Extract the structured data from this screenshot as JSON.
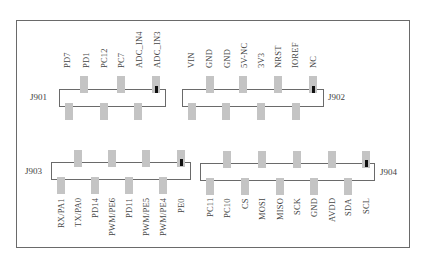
{
  "diagram": {
    "type": "pin-header-layout",
    "frame": {
      "stroke": "#6a6a6a"
    },
    "pin_fill": "#c4c4c4",
    "pin1_marker": "#111111",
    "connectors": [
      {
        "id": "J901",
        "label": "J901",
        "box": {
          "x": 59,
          "y": 89,
          "w": 107,
          "h": 18
        },
        "label_pos": {
          "x": 30,
          "y": 94
        },
        "labels_side": "top",
        "pins_top_x": [
          84,
          121,
          156
        ],
        "pins_bottom_x": [
          69,
          104,
          138
        ],
        "pin1_x": 156,
        "pin_labels": [
          {
            "text": "PD7",
            "x": 67
          },
          {
            "text": "PD1",
            "x": 86
          },
          {
            "text": "PC12",
            "x": 104
          },
          {
            "text": "PC7",
            "x": 121
          },
          {
            "text": "ADC_IN4",
            "x": 139
          },
          {
            "text": "ADC_IN3",
            "x": 157
          }
        ]
      },
      {
        "id": "J902",
        "label": "J902",
        "box": {
          "x": 182,
          "y": 89,
          "w": 142,
          "h": 18
        },
        "label_pos": {
          "x": 328,
          "y": 94
        },
        "labels_side": "top",
        "pins_top_x": [
          210,
          243,
          278,
          313
        ],
        "pins_bottom_x": [
          192,
          226,
          261,
          296
        ],
        "pin1_x": 313,
        "pin_labels": [
          {
            "text": "VIN",
            "x": 191
          },
          {
            "text": "GND",
            "x": 209
          },
          {
            "text": "GND",
            "x": 227
          },
          {
            "text": "5V-NC",
            "x": 244
          },
          {
            "text": "3V3",
            "x": 261
          },
          {
            "text": "NRST",
            "x": 278
          },
          {
            "text": "IOREF",
            "x": 295
          },
          {
            "text": "NC",
            "x": 313
          }
        ]
      },
      {
        "id": "J903",
        "label": "J903",
        "box": {
          "x": 51,
          "y": 162,
          "w": 140,
          "h": 18
        },
        "label_pos": {
          "x": 25,
          "y": 167
        },
        "labels_side": "bottom",
        "pins_top_x": [
          78,
          112,
          146,
          181
        ],
        "pins_bottom_x": [
          61,
          95,
          129,
          163
        ],
        "pin1_x": 181,
        "pin_labels": [
          {
            "text": "RX/PA1",
            "x": 61
          },
          {
            "text": "TX/PA0",
            "x": 78
          },
          {
            "text": "PD14",
            "x": 95
          },
          {
            "text": "PWM/PE6",
            "x": 112
          },
          {
            "text": "PD11",
            "x": 129
          },
          {
            "text": "PWM/PE5",
            "x": 146
          },
          {
            "text": "PWM/PE4",
            "x": 163
          },
          {
            "text": "PE0",
            "x": 181
          }
        ]
      },
      {
        "id": "J904",
        "label": "J904",
        "box": {
          "x": 200,
          "y": 163,
          "w": 175,
          "h": 18
        },
        "label_pos": {
          "x": 380,
          "y": 168
        },
        "labels_side": "bottom",
        "pins_top_x": [
          227,
          262,
          297,
          332,
          366
        ],
        "pins_bottom_x": [
          210,
          245,
          280,
          314,
          348
        ],
        "pin1_x": 366,
        "pin_labels": [
          {
            "text": "PC11",
            "x": 210
          },
          {
            "text": "PC10",
            "x": 227
          },
          {
            "text": "CS",
            "x": 245
          },
          {
            "text": "MOSI",
            "x": 262
          },
          {
            "text": "MISO",
            "x": 280
          },
          {
            "text": "SCK",
            "x": 297
          },
          {
            "text": "GND",
            "x": 314
          },
          {
            "text": "AVDD",
            "x": 332
          },
          {
            "text": "SDA",
            "x": 348
          },
          {
            "text": "SCL",
            "x": 366
          }
        ]
      }
    ]
  }
}
